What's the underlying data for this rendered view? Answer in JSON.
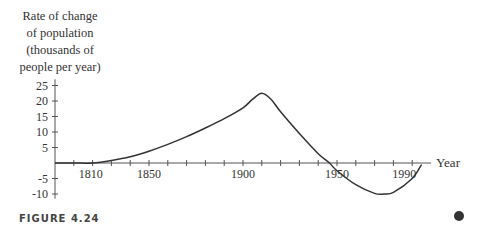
{
  "chart_data": {
    "type": "line",
    "title": "",
    "ylabel": "Rate of change of population (thousands of people per year)",
    "ylabel_lines": [
      "Rate of change",
      "of population",
      "(thousands of",
      "people per year)"
    ],
    "xlabel": "Year",
    "x_tick_labels": [
      "1810",
      "1850",
      "1900",
      "1950",
      "1990"
    ],
    "y_tick_labels": [
      "25",
      "20",
      "15",
      "10",
      "5",
      "-5",
      "-10"
    ],
    "xlim": [
      1800,
      2000
    ],
    "ylim": [
      -12,
      27
    ],
    "grid": false,
    "series": [
      {
        "name": "rate of change",
        "x": [
          1800,
          1810,
          1820,
          1830,
          1840,
          1850,
          1860,
          1870,
          1880,
          1890,
          1900,
          1905,
          1910,
          1915,
          1920,
          1930,
          1940,
          1946,
          1950,
          1960,
          1970,
          1975,
          1980,
          1990,
          1995
        ],
        "y": [
          0,
          0,
          0,
          0.8,
          2,
          3.8,
          6,
          8.5,
          11.3,
          14.3,
          17.8,
          20.5,
          22.5,
          20.5,
          16.5,
          9.5,
          3,
          0,
          -2.5,
          -7,
          -9.8,
          -10,
          -9.5,
          -5,
          -0.5
        ]
      }
    ]
  },
  "figure": {
    "caption": "FIGURE 4.24"
  }
}
